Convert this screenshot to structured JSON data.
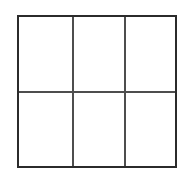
{
  "figure": {
    "kind": "grid-outline",
    "title": "",
    "background_color": "#ffffff",
    "border_color": "#2b2b2b",
    "divider_color": "#4e4e4e",
    "border_width_px": 2.5,
    "divider_width_px": 1.6,
    "columns": 3,
    "rows": 2,
    "frame": {
      "left_px": 17,
      "top_px": 15,
      "width_px": 160,
      "height_px": 153
    },
    "column_divider_positions_px": [
      53,
      105
    ],
    "row_divider_positions_px": [
      74
    ],
    "cells": [
      {
        "id": "r1c1",
        "row": 1,
        "column": 1,
        "text": ""
      },
      {
        "id": "r1c2",
        "row": 1,
        "column": 2,
        "text": ""
      },
      {
        "id": "r1c3",
        "row": 1,
        "column": 3,
        "text": ""
      },
      {
        "id": "r2c1",
        "row": 2,
        "column": 1,
        "text": ""
      },
      {
        "id": "r2c2",
        "row": 2,
        "column": 2,
        "text": ""
      },
      {
        "id": "r2c3",
        "row": 2,
        "column": 3,
        "text": ""
      }
    ]
  }
}
